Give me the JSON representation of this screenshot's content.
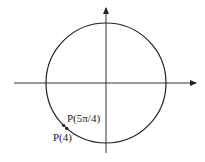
{
  "diagram": {
    "type": "unit-circle",
    "colors": {
      "stroke": "#222222",
      "axis": "#333333",
      "background": "#ffffff"
    },
    "points": [
      {
        "id": "p-5pi-4",
        "label": "P(5π/4)",
        "angle_rad": 3.92699
      },
      {
        "id": "p-4",
        "label": "P(4)",
        "angle_rad": 4.0
      }
    ]
  }
}
